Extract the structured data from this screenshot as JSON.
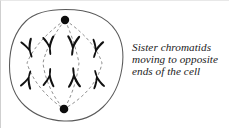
{
  "figure": {
    "name": "anaphase-cell-diagram",
    "caption_lines": [
      "Sister chromatids",
      "moving to opposite",
      "ends of the cell"
    ],
    "caption_full": "Sister chromatids moving to opposite ends of the cell"
  },
  "cell": {
    "membrane_label": "cell-membrane",
    "outline_color": "#5a5a5a",
    "fill_color": "#ffffff"
  },
  "poles": [
    {
      "label": "top-spindle-pole",
      "cx": 64,
      "cy": 19,
      "r": 4.2,
      "color": "#0d0d0d"
    },
    {
      "label": "bottom-spindle-pole",
      "cx": 63,
      "cy": 108,
      "r": 4.2,
      "color": "#0d0d0d"
    }
  ],
  "spindle_fibers": {
    "label": "spindle-fiber",
    "color": "#8a8a8a",
    "dash": "3,2.6",
    "count": 8,
    "paths": [
      "M64,19 C40,36 30,52 26,62 C30,76 42,94 63,108",
      "M64,19 C50,37 44,52 42,62 C44,78 51,95 63,108",
      "M64,19 C72,37 76,52 78,62 C76,78 71,95 63,108",
      "M64,19 C88,35 98,52 101,62 C98,78 86,95 63,108"
    ]
  },
  "chromatids": {
    "label": "sister-chromatid",
    "color": "#111111",
    "top_row": [
      {
        "id": "chromatid-top-1",
        "x": 28,
        "y": 50,
        "rot": -18
      },
      {
        "id": "chromatid-top-2",
        "x": 48,
        "y": 47,
        "rot": -6
      },
      {
        "id": "chromatid-top-3",
        "x": 71,
        "y": 47,
        "rot": 6
      },
      {
        "id": "chromatid-top-4",
        "x": 94,
        "y": 50,
        "rot": 16
      }
    ],
    "bottom_row": [
      {
        "id": "chromatid-bottom-1",
        "x": 27,
        "y": 76,
        "rot": 16
      },
      {
        "id": "chromatid-bottom-2",
        "x": 48,
        "y": 74,
        "rot": 5
      },
      {
        "id": "chromatid-bottom-3",
        "x": 72,
        "y": 74,
        "rot": -5
      },
      {
        "id": "chromatid-bottom-4",
        "x": 95,
        "y": 76,
        "rot": -15
      }
    ],
    "top_count": 4,
    "bottom_count": 4
  },
  "colors": {
    "ink": "#111111",
    "membrane": "#5a5a5a",
    "fiber": "#8a8a8a",
    "text": "#1b1b1b",
    "background": "#ffffff"
  }
}
